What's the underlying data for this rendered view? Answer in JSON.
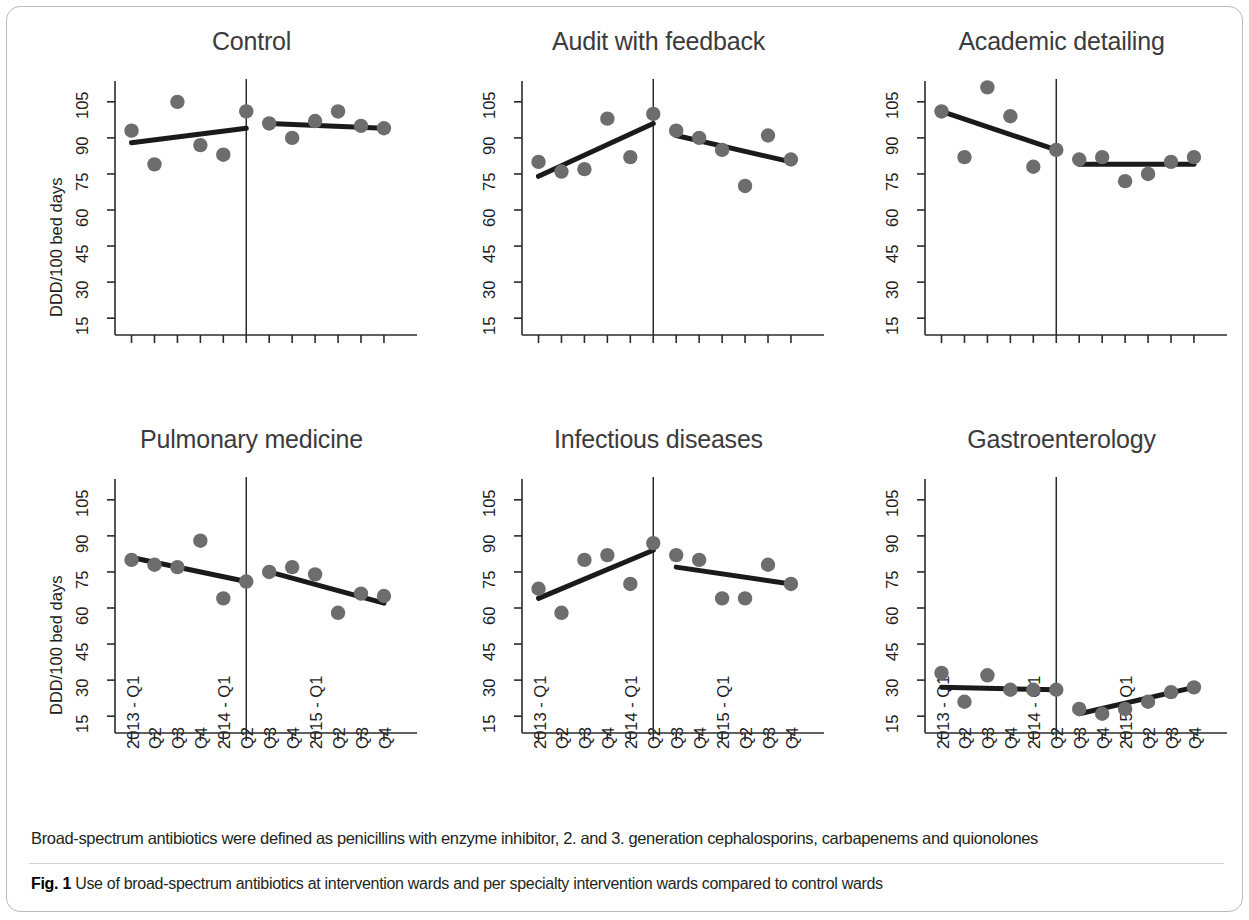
{
  "figure": {
    "label": "Fig. 1",
    "caption": "Use of broad-spectrum antibiotics at intervention wards and per specialty intervention wards compared to control wards",
    "note": "Broad-spectrum antibiotics were defined as penicillins with enzyme inhibitor, 2. and 3. generation cephalosporins, carbapenems and quionolones"
  },
  "axis": {
    "ylabel": "DDD/100 bed days",
    "yticks": [
      "15",
      "30",
      "45",
      "60",
      "75",
      "90",
      "105"
    ],
    "ytick_values": [
      15,
      30,
      45,
      60,
      75,
      90,
      105
    ],
    "ylim": [
      8,
      112
    ],
    "xticks": [
      "2013 - Q1",
      "Q2",
      "Q3",
      "Q4",
      "2014 - Q1",
      "Q2",
      "Q3",
      "Q4",
      "2015 - Q1",
      "Q2",
      "Q3",
      "Q4"
    ],
    "intervention_after_index": 5
  },
  "colors": {
    "point": "#6d6d6d",
    "line": "#1a1a1a",
    "axis": "#2b2b2b",
    "title": "#3b3b3d",
    "text": "#231f20",
    "card_border": "#b9b9bb"
  },
  "chart_data": [
    {
      "type": "scatter",
      "title": "Control",
      "xlabel": "",
      "ylabel": "DDD/100 bed days",
      "ylim": [
        8,
        112
      ],
      "grid": false,
      "legend": "none",
      "x": [
        "2013 - Q1",
        "Q2",
        "Q3",
        "Q4",
        "2014 - Q1",
        "Q2",
        "Q3",
        "Q4",
        "2015 - Q1",
        "Q2",
        "Q3",
        "Q4"
      ],
      "values": [
        93,
        79,
        105,
        87,
        83,
        101,
        96,
        90,
        97,
        101,
        95,
        94
      ],
      "segments": [
        {
          "name": "pre-intervention trend",
          "x_start": 0,
          "x_end": 5,
          "y_start": 88,
          "y_end": 94
        },
        {
          "name": "post-intervention trend",
          "x_start": 6,
          "x_end": 11,
          "y_start": 96,
          "y_end": 94
        }
      ]
    },
    {
      "type": "scatter",
      "title": "Audit with feedback",
      "xlabel": "",
      "ylabel": "",
      "ylim": [
        8,
        112
      ],
      "grid": false,
      "legend": "none",
      "x": [
        "2013 - Q1",
        "Q2",
        "Q3",
        "Q4",
        "2014 - Q1",
        "Q2",
        "Q3",
        "Q4",
        "2015 - Q1",
        "Q2",
        "Q3",
        "Q4"
      ],
      "values": [
        80,
        76,
        77,
        98,
        82,
        100,
        93,
        90,
        85,
        70,
        91,
        81
      ],
      "segments": [
        {
          "name": "pre-intervention trend",
          "x_start": 0,
          "x_end": 5,
          "y_start": 74,
          "y_end": 96
        },
        {
          "name": "post-intervention trend",
          "x_start": 6,
          "x_end": 11,
          "y_start": 91,
          "y_end": 80
        }
      ]
    },
    {
      "type": "scatter",
      "title": "Academic detailing",
      "xlabel": "",
      "ylabel": "",
      "ylim": [
        8,
        112
      ],
      "grid": false,
      "legend": "none",
      "x": [
        "2013 - Q1",
        "Q2",
        "Q3",
        "Q4",
        "2014 - Q1",
        "Q2",
        "Q3",
        "Q4",
        "2015 - Q1",
        "Q2",
        "Q3",
        "Q4"
      ],
      "values": [
        101,
        82,
        111,
        99,
        78,
        85,
        81,
        82,
        72,
        75,
        80,
        82
      ],
      "segments": [
        {
          "name": "pre-intervention trend",
          "x_start": 0,
          "x_end": 5,
          "y_start": 101,
          "y_end": 85
        },
        {
          "name": "post-intervention trend",
          "x_start": 6,
          "x_end": 11,
          "y_start": 79,
          "y_end": 79
        }
      ]
    },
    {
      "type": "scatter",
      "title": "Pulmonary medicine",
      "xlabel": "",
      "ylabel": "DDD/100 bed days",
      "ylim": [
        8,
        112
      ],
      "grid": false,
      "legend": "none",
      "x": [
        "2013 - Q1",
        "Q2",
        "Q3",
        "Q4",
        "2014 - Q1",
        "Q2",
        "Q3",
        "Q4",
        "2015 - Q1",
        "Q2",
        "Q3",
        "Q4"
      ],
      "values": [
        80,
        78,
        77,
        88,
        64,
        71,
        75,
        77,
        74,
        58,
        66,
        65
      ],
      "segments": [
        {
          "name": "pre-intervention trend",
          "x_start": 0,
          "x_end": 5,
          "y_start": 81,
          "y_end": 71
        },
        {
          "name": "post-intervention trend",
          "x_start": 6,
          "x_end": 11,
          "y_start": 75,
          "y_end": 62
        }
      ]
    },
    {
      "type": "scatter",
      "title": "Infectious diseases",
      "xlabel": "",
      "ylabel": "",
      "ylim": [
        8,
        112
      ],
      "grid": false,
      "legend": "none",
      "x": [
        "2013 - Q1",
        "Q2",
        "Q3",
        "Q4",
        "2014 - Q1",
        "Q2",
        "Q3",
        "Q4",
        "2015 - Q1",
        "Q2",
        "Q3",
        "Q4"
      ],
      "values": [
        68,
        58,
        80,
        82,
        70,
        87,
        82,
        80,
        64,
        64,
        78,
        70
      ],
      "segments": [
        {
          "name": "pre-intervention trend",
          "x_start": 0,
          "x_end": 5,
          "y_start": 64,
          "y_end": 84
        },
        {
          "name": "post-intervention trend",
          "x_start": 6,
          "x_end": 11,
          "y_start": 77,
          "y_end": 70
        }
      ]
    },
    {
      "type": "scatter",
      "title": "Gastroenterology",
      "xlabel": "",
      "ylabel": "",
      "ylim": [
        8,
        112
      ],
      "grid": false,
      "legend": "none",
      "x": [
        "2013 - Q1",
        "Q2",
        "Q3",
        "Q4",
        "2014 - Q1",
        "Q2",
        "Q3",
        "Q4",
        "2015 - Q1",
        "Q2",
        "Q3",
        "Q4"
      ],
      "values": [
        33,
        21,
        32,
        26,
        26,
        26,
        18,
        16,
        18,
        21,
        25,
        27
      ],
      "segments": [
        {
          "name": "pre-intervention trend",
          "x_start": 0,
          "x_end": 5,
          "y_start": 27,
          "y_end": 26
        },
        {
          "name": "post-intervention trend",
          "x_start": 6,
          "x_end": 11,
          "y_start": 16,
          "y_end": 27
        }
      ]
    }
  ]
}
